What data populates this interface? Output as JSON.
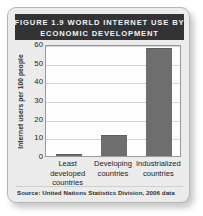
{
  "figure": {
    "title_line_1": "FIGURE 1.9 WORLD INTERNET USE BY",
    "title_line_2": "ECONOMIC DEVELOPMENT",
    "source_note": "Source: United Nations Statistics Division, 2006 data"
  },
  "colors": {
    "card_background": "#ebebeb",
    "title_bar": "#333335",
    "title_text": "#f2f2f2",
    "plot_background": "#fdfdfd",
    "bar_fill": "#6e6e70",
    "gridline": "#d4d4d4",
    "axis_line": "#9a9a9a"
  },
  "chart_data": {
    "type": "bar",
    "title": "FIGURE 1.9 WORLD INTERNET USE BY ECONOMIC DEVELOPMENT",
    "subtitle": "",
    "categories": [
      "Least developed countries",
      "Developing countries",
      "Industrialized countries"
    ],
    "category_lines": [
      [
        "Least",
        "developed",
        "countries"
      ],
      [
        "Developing",
        "countries"
      ],
      [
        "Industrialized",
        "countries"
      ]
    ],
    "values": [
      1,
      11,
      58
    ],
    "xlabel": "",
    "ylabel": "Internet users per 100 people",
    "ylim": [
      0,
      60
    ],
    "yticks": [
      60,
      50,
      40,
      30,
      20,
      10,
      0
    ],
    "ytick_labels": [
      "60",
      "50",
      "40",
      "30",
      "20",
      "10",
      "0"
    ],
    "grid": true,
    "legend": false,
    "legend_position": "none",
    "source": "Source: United Nations Statistics Division, 2006 data",
    "series": [
      {
        "name": "Internet users per 100 people",
        "values": [
          1,
          11,
          58
        ]
      }
    ]
  }
}
